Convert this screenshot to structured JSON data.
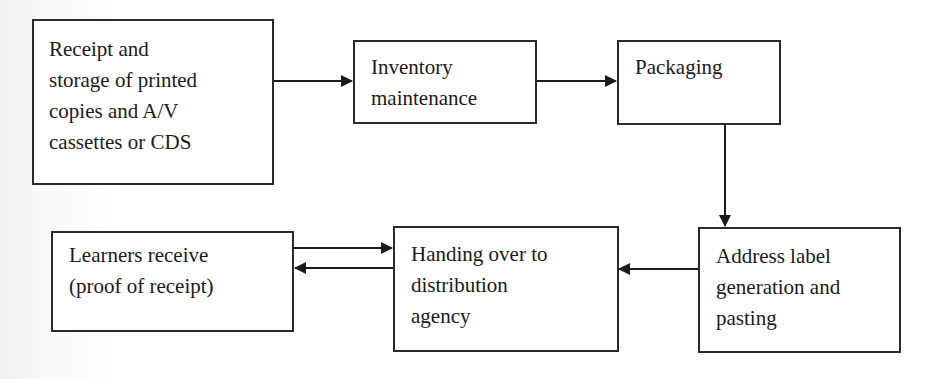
{
  "diagram": {
    "type": "flowchart",
    "nodes": [
      {
        "id": "receipt",
        "label": "Receipt and\nstorage of printed\ncopies and A/V\ncassettes or CDS"
      },
      {
        "id": "inventory",
        "label": "Inventory\nmaintenance"
      },
      {
        "id": "packaging",
        "label": "Packaging"
      },
      {
        "id": "address",
        "label": "Address label\ngeneration and\npasting"
      },
      {
        "id": "handing",
        "label": "Handing over to\ndistribution\nagency"
      },
      {
        "id": "learners",
        "label": "Learners receive\n(proof of receipt)"
      }
    ],
    "edges": [
      {
        "from": "receipt",
        "to": "inventory"
      },
      {
        "from": "inventory",
        "to": "packaging"
      },
      {
        "from": "packaging",
        "to": "address"
      },
      {
        "from": "address",
        "to": "handing"
      },
      {
        "from": "learners",
        "to": "handing"
      },
      {
        "from": "handing",
        "to": "learners"
      }
    ],
    "colors": {
      "stroke": "#2a2a2a",
      "text": "#1a1a1a",
      "background": "#ffffff"
    }
  }
}
